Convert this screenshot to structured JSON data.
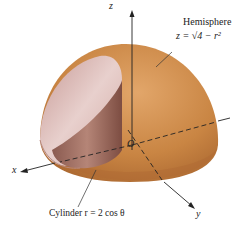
{
  "figure": {
    "labels": {
      "hemisphere_name": "Hemisphere",
      "hemisphere_equation": "z = √4 − r²",
      "cylinder": "Cylinder r = 2 cos θ",
      "axis_x": "x",
      "axis_y": "y",
      "axis_z": "z",
      "origin": "O"
    },
    "colors": {
      "hemisphere": "#c98543",
      "hemisphere_highlight": "#e2a66a",
      "hemisphere_shadow": "#a8652f",
      "cylinder_outer": "#d9b3b0",
      "cylinder_inner": "#9c6a5e",
      "axis": "#222222"
    }
  }
}
